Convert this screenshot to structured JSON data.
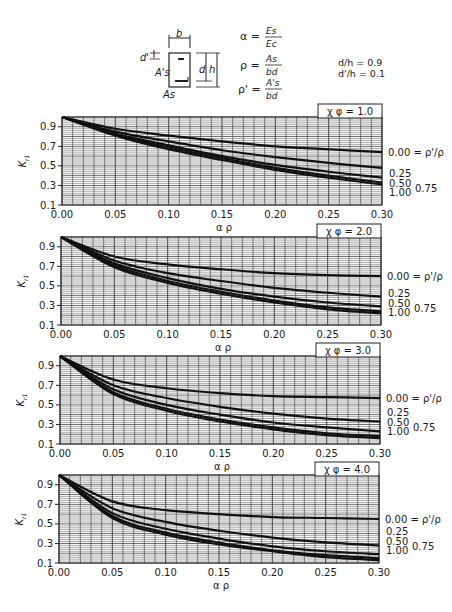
{
  "header": {
    "section": {
      "b": "b",
      "d_prime": "d'",
      "d": "d",
      "h": "h",
      "As_prime": "A's",
      "As": "As"
    },
    "formulas": [
      {
        "lhs": "α =",
        "num": "Es",
        "den": "Ec"
      },
      {
        "lhs": "ρ =",
        "num": "As",
        "den": "bd"
      },
      {
        "lhs": "ρ' =",
        "num": "A's",
        "den": "bd"
      }
    ],
    "ratios": [
      "d/h = 0.9",
      "d'/h = 0.1"
    ]
  },
  "axes": {
    "xlabel": "α ρ",
    "ylabel": "Kr1",
    "xticks": [
      "0.00",
      "0.05",
      "0.10",
      "0.15",
      "0.20",
      "0.25",
      "0.30"
    ],
    "yticks": [
      "0.9",
      "0.7",
      "0.5",
      "0.3",
      "0.1"
    ]
  },
  "curve_labels": {
    "c0": "0.00 = ρ'/ρ",
    "c25": "0.25",
    "c50": "0.50",
    "c75": "0.75",
    "c100": "1.00"
  },
  "panels": [
    {
      "label": "χ φ = 1.0"
    },
    {
      "label": "χ φ = 2.0"
    },
    {
      "label": "χ φ = 3.0"
    },
    {
      "label": "χ φ = 4.0"
    }
  ],
  "chart_data": [
    {
      "type": "line",
      "title": "χφ = 1.0",
      "xlabel": "αρ",
      "ylabel": "Kr1",
      "xlim": [
        0,
        0.3
      ],
      "ylim": [
        0.1,
        1.0
      ],
      "grid": true,
      "x": [
        0,
        0.05,
        0.1,
        0.15,
        0.2,
        0.25,
        0.3
      ],
      "series": [
        {
          "name": "ρ'/ρ = 0.00",
          "values": [
            1.0,
            0.88,
            0.81,
            0.75,
            0.7,
            0.67,
            0.64
          ]
        },
        {
          "name": "ρ'/ρ = 0.25",
          "values": [
            1.0,
            0.85,
            0.75,
            0.66,
            0.59,
            0.53,
            0.48
          ]
        },
        {
          "name": "ρ'/ρ = 0.50",
          "values": [
            1.0,
            0.83,
            0.71,
            0.6,
            0.51,
            0.44,
            0.38
          ]
        },
        {
          "name": "ρ'/ρ = 0.75",
          "values": [
            1.0,
            0.82,
            0.69,
            0.58,
            0.48,
            0.4,
            0.33
          ]
        },
        {
          "name": "ρ'/ρ = 1.00",
          "values": [
            1.0,
            0.81,
            0.67,
            0.56,
            0.46,
            0.38,
            0.31
          ]
        }
      ]
    },
    {
      "type": "line",
      "title": "χφ = 2.0",
      "xlabel": "αρ",
      "ylabel": "Kr1",
      "xlim": [
        0,
        0.3
      ],
      "ylim": [
        0.1,
        1.0
      ],
      "grid": true,
      "x": [
        0,
        0.05,
        0.1,
        0.15,
        0.2,
        0.25,
        0.3
      ],
      "series": [
        {
          "name": "ρ'/ρ = 0.00",
          "values": [
            1.0,
            0.8,
            0.72,
            0.67,
            0.63,
            0.61,
            0.6
          ]
        },
        {
          "name": "ρ'/ρ = 0.25",
          "values": [
            1.0,
            0.76,
            0.63,
            0.55,
            0.48,
            0.43,
            0.39
          ]
        },
        {
          "name": "ρ'/ρ = 0.50",
          "values": [
            1.0,
            0.73,
            0.58,
            0.47,
            0.39,
            0.33,
            0.29
          ]
        },
        {
          "name": "ρ'/ρ = 0.75",
          "values": [
            1.0,
            0.71,
            0.55,
            0.44,
            0.35,
            0.28,
            0.24
          ]
        },
        {
          "name": "ρ'/ρ = 1.00",
          "values": [
            1.0,
            0.69,
            0.53,
            0.42,
            0.33,
            0.26,
            0.22
          ]
        }
      ]
    },
    {
      "type": "line",
      "title": "χφ = 3.0",
      "xlabel": "αρ",
      "ylabel": "Kr1",
      "xlim": [
        0,
        0.3
      ],
      "ylim": [
        0.1,
        1.0
      ],
      "grid": true,
      "x": [
        0,
        0.05,
        0.1,
        0.15,
        0.2,
        0.25,
        0.3
      ],
      "series": [
        {
          "name": "ρ'/ρ = 0.00",
          "values": [
            1.0,
            0.76,
            0.67,
            0.62,
            0.59,
            0.58,
            0.57
          ]
        },
        {
          "name": "ρ'/ρ = 0.25",
          "values": [
            1.0,
            0.7,
            0.57,
            0.48,
            0.41,
            0.36,
            0.33
          ]
        },
        {
          "name": "ρ'/ρ = 0.50",
          "values": [
            1.0,
            0.66,
            0.5,
            0.4,
            0.32,
            0.27,
            0.23
          ]
        },
        {
          "name": "ρ'/ρ = 0.75",
          "values": [
            1.0,
            0.63,
            0.46,
            0.35,
            0.27,
            0.21,
            0.18
          ]
        },
        {
          "name": "ρ'/ρ = 1.00",
          "values": [
            1.0,
            0.61,
            0.44,
            0.33,
            0.25,
            0.19,
            0.16
          ]
        }
      ]
    },
    {
      "type": "line",
      "title": "χφ = 4.0",
      "xlabel": "αρ",
      "ylabel": "Kr1",
      "xlim": [
        0,
        0.3
      ],
      "ylim": [
        0.1,
        1.0
      ],
      "grid": true,
      "x": [
        0,
        0.05,
        0.1,
        0.15,
        0.2,
        0.25,
        0.3
      ],
      "series": [
        {
          "name": "ρ'/ρ = 0.00",
          "values": [
            1.0,
            0.73,
            0.64,
            0.6,
            0.57,
            0.56,
            0.55
          ]
        },
        {
          "name": "ρ'/ρ = 0.25",
          "values": [
            1.0,
            0.66,
            0.52,
            0.43,
            0.36,
            0.31,
            0.28
          ]
        },
        {
          "name": "ρ'/ρ = 0.50",
          "values": [
            1.0,
            0.61,
            0.45,
            0.35,
            0.27,
            0.22,
            0.19
          ]
        },
        {
          "name": "ρ'/ρ = 0.75",
          "values": [
            1.0,
            0.58,
            0.41,
            0.31,
            0.23,
            0.18,
            0.15
          ]
        },
        {
          "name": "ρ'/ρ = 1.00",
          "values": [
            1.0,
            0.56,
            0.39,
            0.29,
            0.22,
            0.16,
            0.13
          ]
        }
      ]
    }
  ]
}
